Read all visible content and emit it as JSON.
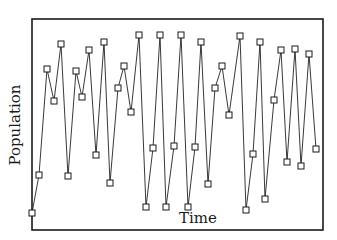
{
  "chart_data": {
    "type": "line",
    "title": "",
    "xlabel": "Time",
    "ylabel": "Population",
    "grid": false,
    "legend": null,
    "markers": "open-square",
    "xlim": [
      1,
      41
    ],
    "ylim": [
      0,
      100
    ],
    "x": [
      1,
      2,
      3,
      4,
      5,
      6,
      7,
      8,
      9,
      10,
      11,
      12,
      13,
      14,
      15,
      16,
      17,
      18,
      19,
      20,
      21,
      22,
      23,
      24,
      25,
      26,
      27,
      28,
      29,
      30,
      31,
      32,
      33,
      34,
      35,
      36,
      37,
      38,
      39,
      40,
      41
    ],
    "series": [
      {
        "name": "Population",
        "values": [
          8,
          26,
          76,
          61,
          88,
          25,
          75,
          63,
          85,
          36,
          89,
          22,
          67,
          78,
          56,
          92,
          11,
          39,
          92,
          11,
          40,
          92,
          11,
          39,
          89,
          22,
          67,
          78,
          54,
          92,
          9,
          36,
          89,
          15,
          62,
          85,
          32,
          85,
          30,
          83,
          38
        ]
      }
    ]
  },
  "plot": {
    "frame": {
      "left": 32,
      "top": 19,
      "right": 323,
      "bottom": 230
    },
    "points_px": [
      [
        32,
        213
      ],
      [
        39,
        175
      ],
      [
        47,
        69
      ],
      [
        54,
        101
      ],
      [
        61,
        44
      ],
      [
        68,
        176
      ],
      [
        76,
        71
      ],
      [
        82,
        97
      ],
      [
        89,
        50
      ],
      [
        96,
        155
      ],
      [
        104,
        42
      ],
      [
        110,
        183
      ],
      [
        118,
        88
      ],
      [
        124,
        66
      ],
      [
        131,
        112
      ],
      [
        139,
        35
      ],
      [
        146,
        207
      ],
      [
        153,
        148
      ],
      [
        160,
        35
      ],
      [
        166,
        207
      ],
      [
        174,
        146
      ],
      [
        181,
        35
      ],
      [
        188,
        207
      ],
      [
        195,
        147
      ],
      [
        201,
        42
      ],
      [
        208,
        184
      ],
      [
        215,
        88
      ],
      [
        222,
        66
      ],
      [
        229,
        115
      ],
      [
        240,
        36
      ],
      [
        246,
        210
      ],
      [
        253,
        154
      ],
      [
        260,
        42
      ],
      [
        265,
        199
      ],
      [
        274,
        100
      ],
      [
        281,
        50
      ],
      [
        287,
        162
      ],
      [
        295,
        49
      ],
      [
        301,
        166
      ],
      [
        309,
        54
      ],
      [
        316,
        149
      ]
    ]
  },
  "labels": {
    "x_axis": "Time",
    "y_axis": "Population"
  }
}
